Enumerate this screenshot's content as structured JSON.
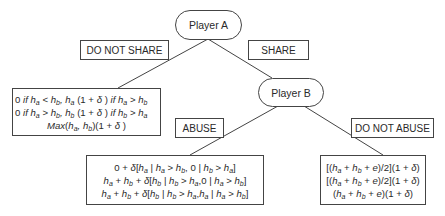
{
  "nodes": {
    "player_a": "Player A",
    "player_b": "Player B"
  },
  "edges": {
    "a_left": "DO NOT SHARE",
    "a_right": "SHARE",
    "b_left": "ABUSE",
    "b_right": "DO NOT ABUSE"
  },
  "payoffs": {
    "do_not_share": [
      "0 if ha < hb, ha (1 + δ ) if ha > hb",
      "0 if ha > hb, hb (1 + δ ) if hb > ha",
      "Max(ha, hb)(1 + δ )"
    ],
    "abuse": [
      "0 + δ[ha | ha > hb, 0 | hb > ha]",
      "ha + hb + δ[hb | hb > ha,0 | ha > hb]",
      "ha + hb + δ[hb | hb > ha,ha | ha > hb]"
    ],
    "do_not_abuse": [
      "[(ha + hb + e)/2](1 + δ)",
      "[(ha + hb + e)/2](1 + δ)",
      "(ha + hb + e)(1 + δ)"
    ]
  },
  "colors": {
    "stroke": "#444444",
    "text": "#2a2a2a",
    "background": "#ffffff"
  }
}
